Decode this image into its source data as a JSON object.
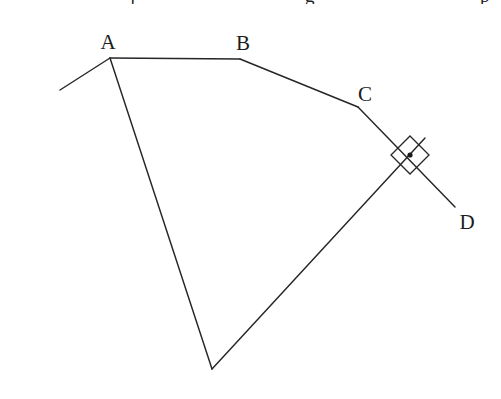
{
  "figure": {
    "name": "geometric-line-figure",
    "width": 501,
    "height": 399,
    "background_color": "#ffffff",
    "stroke_color": "#262626",
    "label_color": "#1c1c1c",
    "stroke_width": 1.45
  },
  "labels": [
    {
      "id": "A",
      "text": "A",
      "x": 108,
      "y": 42
    },
    {
      "id": "B",
      "text": "B",
      "x": 243,
      "y": 43
    },
    {
      "id": "C",
      "text": "C",
      "x": 365,
      "y": 94
    },
    {
      "id": "D",
      "text": "D",
      "x": 467,
      "y": 222
    }
  ],
  "points": {
    "A": {
      "x": 110,
      "y": 58
    },
    "B": {
      "x": 240,
      "y": 59
    },
    "C": {
      "x": 358,
      "y": 107
    },
    "D": {
      "x": 455,
      "y": 207
    },
    "E": {
      "x": 212,
      "y": 369
    },
    "ray_left_end": {
      "x": 60,
      "y": 90
    },
    "ray_upper_right_end": {
      "x": 425,
      "y": 138
    }
  },
  "segments": [
    {
      "name": "segment-ray-left-to-A",
      "d": "M 60 90 L 110 58"
    },
    {
      "name": "segment-A-to-B",
      "d": "M 110 58 L 240 59"
    },
    {
      "name": "segment-B-to-C",
      "d": "M 240 59 L 358 107"
    },
    {
      "name": "segment-C-to-D",
      "d": "M 358 107 L 455 207"
    },
    {
      "name": "segment-A-to-E",
      "d": "M 110 58 L 212 369"
    },
    {
      "name": "segment-E-to-upper-right",
      "d": "M 212 369 L 425 138"
    }
  ],
  "right_angle_marker": {
    "name": "right-angle-square-marker",
    "center_x": 410,
    "center_y": 155,
    "half_diagonal": 19,
    "path": "M 410 136 L 429 155 L 410 174 L 391 155 Z",
    "dot_x": 410,
    "dot_y": 155,
    "dot_radius": 2.6,
    "meaning": "perpendicular"
  },
  "top_cropped_text": [
    {
      "text": "j",
      "x": 130
    },
    {
      "text": "g",
      "x": 305
    },
    {
      "text": "p",
      "x": 480
    }
  ]
}
